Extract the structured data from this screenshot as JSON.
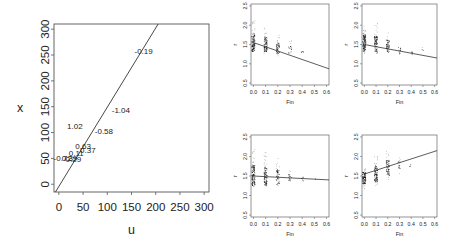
{
  "chart_data": [
    {
      "id": "main",
      "type": "scatter",
      "title": "",
      "xlabel": "u",
      "ylabel": "x",
      "xlim": [
        -10,
        310
      ],
      "ylim": [
        -15,
        310
      ],
      "xticks": [
        0,
        50,
        100,
        150,
        200,
        250,
        300
      ],
      "yticks": [
        0,
        50,
        100,
        150,
        200,
        250,
        300
      ],
      "grid": false,
      "line": {
        "x": [
          -7,
          205
        ],
        "y": [
          -15,
          310
        ]
      },
      "text_points": [
        {
          "x": 175,
          "y": 258,
          "label": "-0.19"
        },
        {
          "x": 128,
          "y": 143,
          "label": "-1.04"
        },
        {
          "x": 33,
          "y": 112,
          "label": "1.02"
        },
        {
          "x": 93,
          "y": 103,
          "label": "-0.58"
        },
        {
          "x": 50,
          "y": 74,
          "label": "0.63"
        },
        {
          "x": 60,
          "y": 67,
          "label": "0.37"
        },
        {
          "x": 36,
          "y": 61,
          "label": "0.11"
        },
        {
          "x": 8,
          "y": 50,
          "label": "-0.72"
        },
        {
          "x": 30,
          "y": 49,
          "label": "0.29"
        },
        {
          "x": 22,
          "y": 50,
          "label": "0.39"
        }
      ]
    },
    {
      "id": "panel_top_left",
      "type": "scatter",
      "xlabel": "Fin",
      "ylabel": "r",
      "xlim": [
        -0.02,
        0.62
      ],
      "ylim": [
        0.45,
        2.55
      ],
      "xticks": [
        0.0,
        0.1,
        0.2,
        0.3,
        0.4,
        0.5,
        0.6
      ],
      "xticklabels": [
        "0.0",
        "0.1",
        "0.2",
        "0.3",
        "0.4",
        "0.5",
        "0.6"
      ],
      "yticks": [
        0.5,
        1.0,
        1.5,
        2.0,
        2.5
      ],
      "yticklabels": [
        "0.5",
        "1.0",
        "1.5",
        "2.0",
        "2.5"
      ],
      "line": {
        "x": [
          0.0,
          0.62
        ],
        "y": [
          1.55,
          0.87
        ]
      },
      "clusters": [
        {
          "x": 0.0,
          "n": 120,
          "ymin": 1.3,
          "ymax": 2.15,
          "center": 1.55
        },
        {
          "x": 0.1,
          "n": 90,
          "ymin": 1.25,
          "ymax": 1.95,
          "center": 1.5
        },
        {
          "x": 0.2,
          "n": 55,
          "ymin": 1.2,
          "ymax": 1.75,
          "center": 1.4
        },
        {
          "x": 0.3,
          "n": 18,
          "ymin": 1.2,
          "ymax": 1.6,
          "center": 1.35
        },
        {
          "x": 0.4,
          "n": 5,
          "ymin": 1.2,
          "ymax": 1.35,
          "center": 1.28
        }
      ]
    },
    {
      "id": "panel_top_right",
      "type": "scatter",
      "xlabel": "Fin",
      "ylabel": "r",
      "xlim": [
        -0.02,
        0.62
      ],
      "ylim": [
        0.45,
        2.55
      ],
      "xticks": [
        0.0,
        0.1,
        0.2,
        0.3,
        0.4,
        0.5,
        0.6
      ],
      "xticklabels": [
        "0.0",
        "0.1",
        "0.2",
        "0.3",
        "0.4",
        "0.5",
        "0.6"
      ],
      "yticks": [
        0.5,
        1.0,
        1.5,
        2.0,
        2.5
      ],
      "yticklabels": [
        "0.5",
        "1.0",
        "1.5",
        "2.0",
        "2.5"
      ],
      "line": {
        "x": [
          0.0,
          0.62
        ],
        "y": [
          1.5,
          1.15
        ]
      },
      "clusters": [
        {
          "x": 0.0,
          "n": 120,
          "ymin": 1.25,
          "ymax": 2.1,
          "center": 1.55
        },
        {
          "x": 0.1,
          "n": 90,
          "ymin": 1.25,
          "ymax": 2.05,
          "center": 1.5
        },
        {
          "x": 0.2,
          "n": 55,
          "ymin": 1.25,
          "ymax": 1.85,
          "center": 1.45
        },
        {
          "x": 0.3,
          "n": 14,
          "ymin": 1.25,
          "ymax": 1.6,
          "center": 1.35
        },
        {
          "x": 0.4,
          "n": 5,
          "ymin": 1.2,
          "ymax": 1.45,
          "center": 1.3
        },
        {
          "x": 0.5,
          "n": 3,
          "ymin": 1.3,
          "ymax": 1.45,
          "center": 1.38
        }
      ]
    },
    {
      "id": "panel_bottom_left",
      "type": "scatter",
      "xlabel": "Fin",
      "ylabel": "r",
      "xlim": [
        -0.02,
        0.62
      ],
      "ylim": [
        0.45,
        2.55
      ],
      "xticks": [
        0.0,
        0.1,
        0.2,
        0.3,
        0.4,
        0.5,
        0.6
      ],
      "xticklabels": [
        "0.0",
        "0.1",
        "0.2",
        "0.3",
        "0.4",
        "0.5",
        "0.6"
      ],
      "yticks": [
        0.5,
        1.0,
        1.5,
        2.0,
        2.5
      ],
      "yticklabels": [
        "0.5",
        "1.0",
        "1.5",
        "2.0",
        "2.5"
      ],
      "line": {
        "x": [
          0.0,
          0.62
        ],
        "y": [
          1.5,
          1.4
        ]
      },
      "clusters": [
        {
          "x": 0.0,
          "n": 130,
          "ymin": 1.2,
          "ymax": 2.2,
          "center": 1.5
        },
        {
          "x": 0.1,
          "n": 100,
          "ymin": 1.2,
          "ymax": 2.1,
          "center": 1.5
        },
        {
          "x": 0.2,
          "n": 55,
          "ymin": 1.25,
          "ymax": 1.95,
          "center": 1.47
        },
        {
          "x": 0.3,
          "n": 18,
          "ymin": 1.3,
          "ymax": 1.65,
          "center": 1.45
        },
        {
          "x": 0.4,
          "n": 6,
          "ymin": 1.35,
          "ymax": 1.55,
          "center": 1.42
        },
        {
          "x": 0.5,
          "n": 2,
          "ymin": 1.4,
          "ymax": 1.45,
          "center": 1.42
        }
      ]
    },
    {
      "id": "panel_bottom_right",
      "type": "scatter",
      "xlabel": "Fin",
      "ylabel": "r",
      "xlim": [
        -0.02,
        0.62
      ],
      "ylim": [
        0.45,
        2.55
      ],
      "xticks": [
        0.0,
        0.1,
        0.2,
        0.3,
        0.4,
        0.5,
        0.6
      ],
      "xticklabels": [
        "0.0",
        "0.1",
        "0.2",
        "0.3",
        "0.4",
        "0.5",
        "0.6"
      ],
      "yticks": [
        0.5,
        1.0,
        1.5,
        2.0,
        2.5
      ],
      "yticklabels": [
        "0.5",
        "1.0",
        "1.5",
        "2.0",
        "2.5"
      ],
      "line": {
        "x": [
          0.0,
          0.62
        ],
        "y": [
          1.55,
          2.15
        ]
      },
      "clusters": [
        {
          "x": 0.0,
          "n": 120,
          "ymin": 1.15,
          "ymax": 1.7,
          "center": 1.45
        },
        {
          "x": 0.1,
          "n": 100,
          "ymin": 1.25,
          "ymax": 2.0,
          "center": 1.55
        },
        {
          "x": 0.2,
          "n": 70,
          "ymin": 1.4,
          "ymax": 2.15,
          "center": 1.7
        },
        {
          "x": 0.3,
          "n": 20,
          "ymin": 1.55,
          "ymax": 2.0,
          "center": 1.78
        },
        {
          "x": 0.4,
          "n": 3,
          "ymin": 1.65,
          "ymax": 1.85,
          "center": 1.75
        }
      ]
    }
  ],
  "layout": {
    "main": {
      "left": 54,
      "top": 24,
      "right": 209,
      "bottom": 192
    },
    "panels": [
      {
        "left": 251,
        "top": 4,
        "right": 329,
        "bottom": 85
      },
      {
        "left": 362,
        "top": 4,
        "right": 437,
        "bottom": 85
      },
      {
        "left": 251,
        "top": 135,
        "right": 329,
        "bottom": 217
      },
      {
        "left": 362,
        "top": 135,
        "right": 437,
        "bottom": 217
      }
    ]
  }
}
